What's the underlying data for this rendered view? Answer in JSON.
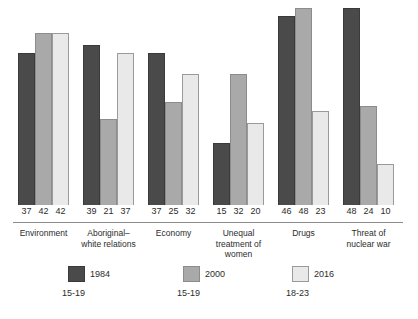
{
  "chart_data": {
    "type": "bar",
    "title": "",
    "subtitle": "",
    "xlabel": "",
    "ylabel": "",
    "ylim": [
      0,
      48
    ],
    "grid": false,
    "legend_position": "bottom",
    "categories": [
      "Environment",
      "Aboriginal–white relations",
      "Economy",
      "Unequal treatment of women",
      "Drugs",
      "Threat of nuclear war"
    ],
    "category_lines": [
      [
        "Environment"
      ],
      [
        "Aboriginal–",
        "white relations"
      ],
      [
        "Economy"
      ],
      [
        "Unequal",
        "treatment of",
        "women"
      ],
      [
        "Drugs"
      ],
      [
        "Threat of",
        "nuclear war"
      ]
    ],
    "series": [
      {
        "name": "1984",
        "sub": "15-19",
        "color": "#4a4a4a",
        "values": [
          37,
          39,
          37,
          15,
          46,
          48
        ]
      },
      {
        "name": "2000",
        "sub": "15-19",
        "color": "#a9a9a9",
        "values": [
          42,
          21,
          25,
          32,
          48,
          24
        ]
      },
      {
        "name": "2016",
        "sub": "18-23",
        "color": "#e9e9e9",
        "values": [
          42,
          37,
          32,
          20,
          23,
          10
        ]
      }
    ]
  },
  "legend": {
    "items": [
      {
        "year": "1984",
        "sub": "15-19"
      },
      {
        "year": "2000",
        "sub": "15-19"
      },
      {
        "year": "2016",
        "sub": "18-23"
      }
    ]
  },
  "colors": {
    "series_1984": "#4a4a4a",
    "series_2000": "#a9a9a9",
    "series_2016": "#e9e9e9",
    "axis": "#8d8d8d",
    "text": "#2b2b2b",
    "background": "#ffffff"
  }
}
